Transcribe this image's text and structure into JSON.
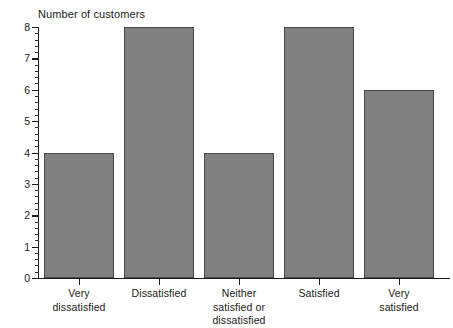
{
  "chart_data": {
    "type": "bar",
    "title": "Number of customers",
    "xlabel": "",
    "ylabel": "Number of customers",
    "categories": [
      "Very dissatisfied",
      "Dissatisfied",
      "Neither satisfied or dissatisfied",
      "Satisfied",
      "Very satisfied"
    ],
    "category_lines": [
      [
        "Very",
        "dissatisfied"
      ],
      [
        "Dissatisfied"
      ],
      [
        "Neither",
        "satisfied or",
        "dissatisfied"
      ],
      [
        "Satisfied"
      ],
      [
        "Very",
        "satisfied"
      ]
    ],
    "values": [
      4,
      8,
      4,
      8,
      6
    ],
    "ylim": [
      0,
      8
    ],
    "ytick_labels": [
      "0",
      "1",
      "2",
      "3",
      "4",
      "5",
      "6",
      "7",
      "8"
    ],
    "ytick_values": [
      0,
      1,
      2,
      3,
      4,
      5,
      6,
      7,
      8
    ],
    "yminor_per_major": 5,
    "grid": false,
    "legend": null,
    "bar_color": "#808080",
    "bar_edge_color": "#4a4a4a",
    "axis_color": "#1a1a1a",
    "background": "#ffffff"
  }
}
